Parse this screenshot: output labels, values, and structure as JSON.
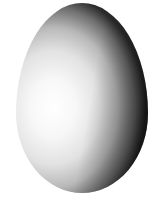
{
  "image": {
    "subject": "egg",
    "background_color": "#ffffff",
    "colors": {
      "highlight": "#ffffff",
      "midtone": "#d0d0d0",
      "shadow": "#1e1e1e"
    }
  }
}
